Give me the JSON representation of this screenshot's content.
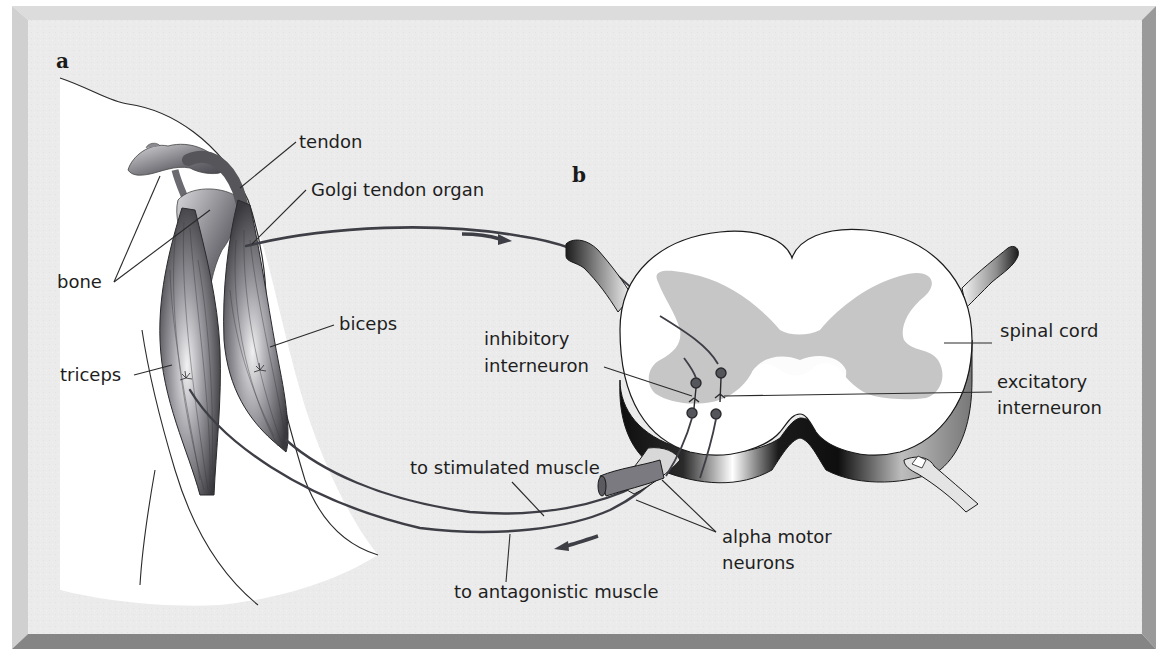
{
  "figure": {
    "panels": [
      {
        "id": "a",
        "letter": "a",
        "description": "Arm with biceps and triceps muscles, bones, tendon and Golgi tendon organ"
      },
      {
        "id": "b",
        "letter": "b",
        "description": "Cross-section of spinal cord with interneurons and motor neurons"
      }
    ],
    "labels": {
      "tendon": "tendon",
      "golgi": "Golgi tendon organ",
      "bone": "bone",
      "biceps": "biceps",
      "triceps": "triceps",
      "inhibitory_1": "inhibitory",
      "inhibitory_2": "interneuron",
      "spinal_cord": "spinal cord",
      "excitatory_1": "excitatory",
      "excitatory_2": "interneuron",
      "stimulated": "to stimulated muscle",
      "alpha_1": "alpha motor",
      "alpha_2": "neurons",
      "antagonistic": "to antagonistic muscle"
    },
    "arrows": [
      {
        "name": "afferent-direction",
        "direction": "toward spinal cord"
      },
      {
        "name": "efferent-direction",
        "direction": "toward muscle"
      }
    ],
    "colors": {
      "background_panel": "#ececec",
      "frame_light": "#d2d2d2",
      "frame_dark": "#8a8a8a",
      "gray_matter": "#c4c4c4",
      "nerve": "#3c3c44",
      "muscle_dark": "#3a3a3e",
      "muscle_light": "#e8e8ea"
    }
  }
}
